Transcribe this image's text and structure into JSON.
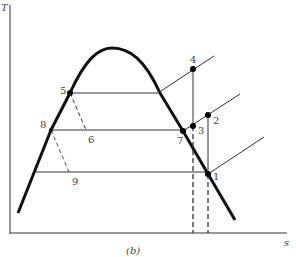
{
  "diagram": {
    "caption": "(b)",
    "axes": {
      "y_label": "T",
      "x_label": "s"
    },
    "points": [
      {
        "id": "1",
        "label": "1"
      },
      {
        "id": "2",
        "label": "2"
      },
      {
        "id": "3",
        "label": "3"
      },
      {
        "id": "4",
        "label": "4"
      },
      {
        "id": "5",
        "label": "5"
      },
      {
        "id": "6",
        "label": "6"
      },
      {
        "id": "7",
        "label": "7"
      },
      {
        "id": "8",
        "label": "8"
      },
      {
        "id": "9",
        "label": "9"
      }
    ],
    "colors": {
      "line": "#1a1a1a",
      "text": "#444444"
    }
  }
}
